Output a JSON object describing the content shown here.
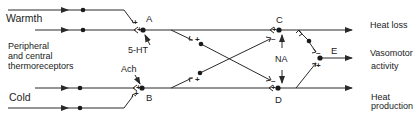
{
  "diagram": {
    "inputs": {
      "warmth": "Warmth",
      "receptors": [
        "Peripheral",
        "and central",
        "thermoreceptors"
      ],
      "cold": "Cold"
    },
    "nodes": {
      "A": "A",
      "B": "B",
      "C": "C",
      "D": "D",
      "E": "E"
    },
    "transmitters": {
      "serotonin": "5-HT",
      "acetylcholine": "Ach",
      "noradrenaline": "NA"
    },
    "outputs": {
      "heat_loss": "Heat loss",
      "vasomotor": [
        "Vasomotor",
        "activity"
      ],
      "heat_production": [
        "Heat",
        "production"
      ]
    },
    "signs": {
      "plus": "+",
      "minus": "–"
    },
    "line_color": "#2a2a2a"
  }
}
